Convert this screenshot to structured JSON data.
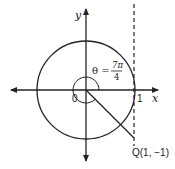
{
  "diagram": {
    "type": "unit-circle-angle",
    "axes": {
      "x_label": "x",
      "y_label": "y",
      "origin_label": "0"
    },
    "tick_label": "1",
    "angle": {
      "theta_label": "θ =",
      "numerator": "7π",
      "denominator": "4"
    },
    "point": {
      "label": "Q(1, −1)"
    },
    "tangent_line": "x = 1 (dashed)",
    "colors": {
      "stroke": "#222222",
      "background": "#ffffff"
    }
  }
}
